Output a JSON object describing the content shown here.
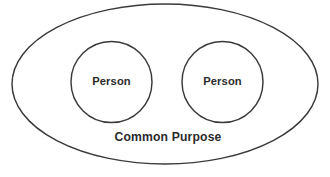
{
  "diagram": {
    "type": "venn-style-containment-diagram",
    "background_color": "#ffffff",
    "stroke_color": "#3a3a3a",
    "text_color": "#2b2b2b",
    "container": {
      "shape": "ellipse",
      "label": "Common Purpose",
      "cx": 165,
      "cy": 84,
      "rx": 153,
      "ry": 80,
      "label_x": 168,
      "label_y": 138
    },
    "members": [
      {
        "shape": "circle",
        "label": "Person",
        "cx": 111.5,
        "cy": 82,
        "r": 40.5
      },
      {
        "shape": "circle",
        "label": "Person",
        "cx": 222.5,
        "cy": 82,
        "r": 40.5
      }
    ]
  }
}
